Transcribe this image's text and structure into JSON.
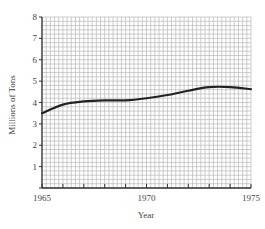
{
  "chart_data": {
    "type": "line",
    "title": "",
    "xlabel": "Year",
    "ylabel": "Millions of Tons",
    "x": [
      1965,
      1966,
      1967,
      1968,
      1969,
      1970,
      1971,
      1972,
      1973,
      1974,
      1975
    ],
    "series": [
      {
        "name": "Millions of Tons",
        "values": [
          3.5,
          3.9,
          4.05,
          4.1,
          4.1,
          4.2,
          4.35,
          4.55,
          4.72,
          4.72,
          4.62
        ],
        "color": "#222222"
      }
    ],
    "xlim": [
      1965,
      1975
    ],
    "ylim": [
      0,
      8
    ],
    "x_tick_labels": [
      "1965",
      "1970",
      "1975"
    ],
    "y_tick_labels": [
      "1",
      "2",
      "3",
      "4",
      "5",
      "6",
      "7",
      "8"
    ],
    "grid": true,
    "legend": "none"
  },
  "labels": {
    "xlabel": "Year",
    "ylabel": "Millions of Tons"
  }
}
